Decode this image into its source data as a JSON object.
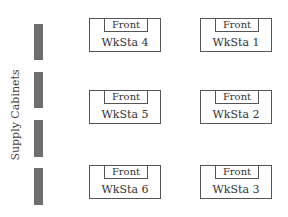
{
  "side_label": "Supply Cabinets",
  "cabinets": [
    {
      "top": 24,
      "height": 36
    },
    {
      "top": 72,
      "height": 36
    },
    {
      "top": 120,
      "height": 37
    },
    {
      "top": 168,
      "height": 37
    }
  ],
  "workstations": [
    {
      "name": "WkSta 4",
      "front": "Front"
    },
    {
      "name": "WkSta 1",
      "front": "Front"
    },
    {
      "name": "WkSta 5",
      "front": "Front"
    },
    {
      "name": "WkSta 2",
      "front": "Front"
    },
    {
      "name": "WkSta 6",
      "front": "Front"
    },
    {
      "name": "WkSta 3",
      "front": "Front"
    }
  ],
  "colors": {
    "cabinet": "#6e6e6e",
    "outline": "#555555"
  }
}
